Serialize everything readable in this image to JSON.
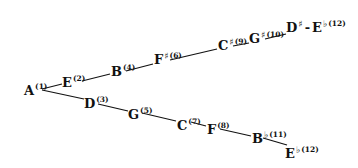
{
  "diagram": {
    "title": "",
    "start": {
      "note": "A",
      "acc": "",
      "num": "(1)"
    },
    "upper_branch": [
      {
        "note": "E",
        "acc": "",
        "num": "(2)"
      },
      {
        "note": "B",
        "acc": "",
        "num": "(4)"
      },
      {
        "note": "F",
        "acc": "♯",
        "num": "(6)"
      },
      {
        "note": "C",
        "acc": "♯",
        "num": "(9)"
      },
      {
        "note": "G",
        "acc": "♯",
        "num": "(10)"
      },
      {
        "note": "D",
        "acc": "♯",
        "dash": "-",
        "note2": "E",
        "acc2": "♭",
        "num": "(12)"
      }
    ],
    "lower_branch": [
      {
        "note": "D",
        "acc": "",
        "num": "(3)"
      },
      {
        "note": "G",
        "acc": "",
        "num": "(5)"
      },
      {
        "note": "C",
        "acc": "",
        "num": "(7)"
      },
      {
        "note": "F",
        "acc": "",
        "num": "(8)"
      },
      {
        "note": "B",
        "acc": "♭",
        "num": "(11)"
      },
      {
        "note": "E",
        "acc": "♭",
        "num": "(12)"
      }
    ],
    "colors": {
      "ink": "#111111",
      "background": "#ffffff"
    }
  }
}
